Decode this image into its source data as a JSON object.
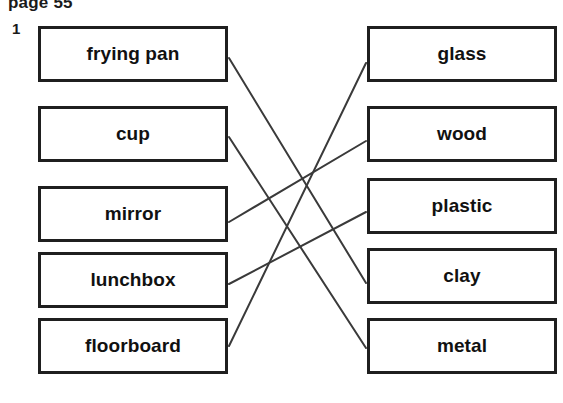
{
  "header": {
    "page_label": "page 55",
    "question_number": "1"
  },
  "colors": {
    "box_border": "#1f1f1f",
    "text": "#111111",
    "line": "#3a3a3a",
    "background": "#ffffff"
  },
  "left_column": [
    {
      "label": "frying pan",
      "x": 38,
      "y": 26
    },
    {
      "label": "cup",
      "x": 38,
      "y": 106
    },
    {
      "label": "mirror",
      "x": 38,
      "y": 186
    },
    {
      "label": "lunchbox",
      "x": 38,
      "y": 252
    },
    {
      "label": "floorboard",
      "x": 38,
      "y": 318
    }
  ],
  "right_column": [
    {
      "label": "glass",
      "x": 367,
      "y": 26
    },
    {
      "label": "wood",
      "x": 367,
      "y": 106
    },
    {
      "label": "plastic",
      "x": 367,
      "y": 178
    },
    {
      "label": "clay",
      "x": 367,
      "y": 248
    },
    {
      "label": "metal",
      "x": 367,
      "y": 318
    }
  ],
  "connections": [
    {
      "from": "frying pan",
      "to": "clay",
      "x1": 229,
      "y1": 58,
      "x2": 366,
      "y2": 283
    },
    {
      "from": "cup",
      "to": "metal",
      "x1": 229,
      "y1": 137,
      "x2": 366,
      "y2": 348
    },
    {
      "from": "mirror",
      "to": "wood",
      "x1": 229,
      "y1": 222,
      "x2": 366,
      "y2": 141
    },
    {
      "from": "lunchbox",
      "to": "plastic",
      "x1": 229,
      "y1": 284,
      "x2": 366,
      "y2": 212
    },
    {
      "from": "floorboard",
      "to": "glass",
      "x1": 229,
      "y1": 346,
      "x2": 366,
      "y2": 63
    }
  ]
}
